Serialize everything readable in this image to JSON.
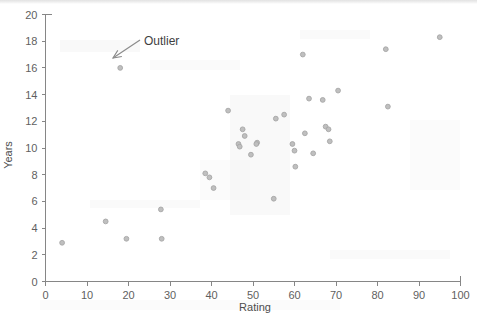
{
  "chart_data": {
    "type": "scatter",
    "title": "",
    "xlabel": "Rating",
    "ylabel": "Years",
    "xlim": [
      0,
      100
    ],
    "ylim": [
      0,
      20
    ],
    "xticks": [
      0,
      10,
      20,
      30,
      40,
      50,
      60,
      70,
      80,
      90,
      100
    ],
    "yticks": [
      0,
      2,
      4,
      6,
      8,
      10,
      12,
      14,
      16,
      18,
      20
    ],
    "xtick_labels": [
      "0",
      "10",
      "20",
      "30",
      "40",
      "50",
      "60",
      "70",
      "80",
      "90",
      "100"
    ],
    "ytick_labels": [
      "0",
      "2",
      "4",
      "6",
      "8",
      "10",
      "12",
      "14",
      "16",
      "18",
      "20"
    ],
    "grid": false,
    "legend": false,
    "marker_color": "#bfbfbf",
    "marker_edge_color": "#a6a6a6",
    "points": [
      {
        "x": 4,
        "y": 2.9
      },
      {
        "x": 14.5,
        "y": 4.5
      },
      {
        "x": 18,
        "y": 16.0
      },
      {
        "x": 19.5,
        "y": 3.2
      },
      {
        "x": 27.8,
        "y": 5.4
      },
      {
        "x": 28,
        "y": 3.2
      },
      {
        "x": 38.5,
        "y": 8.1
      },
      {
        "x": 39.5,
        "y": 7.8
      },
      {
        "x": 40.5,
        "y": 7.0
      },
      {
        "x": 44,
        "y": 12.8
      },
      {
        "x": 47.5,
        "y": 11.4
      },
      {
        "x": 48,
        "y": 10.9
      },
      {
        "x": 46.5,
        "y": 10.3
      },
      {
        "x": 46.8,
        "y": 10.1
      },
      {
        "x": 49.5,
        "y": 9.5
      },
      {
        "x": 51,
        "y": 10.4
      },
      {
        "x": 50.8,
        "y": 10.3
      },
      {
        "x": 55,
        "y": 6.2
      },
      {
        "x": 55.5,
        "y": 12.2
      },
      {
        "x": 57.5,
        "y": 12.5
      },
      {
        "x": 59.5,
        "y": 10.3
      },
      {
        "x": 60,
        "y": 9.8
      },
      {
        "x": 60.2,
        "y": 8.6
      },
      {
        "x": 62,
        "y": 17.0
      },
      {
        "x": 62.5,
        "y": 11.1
      },
      {
        "x": 63.5,
        "y": 13.7
      },
      {
        "x": 64.5,
        "y": 9.6
      },
      {
        "x": 66.8,
        "y": 13.6
      },
      {
        "x": 67.5,
        "y": 11.6
      },
      {
        "x": 68.2,
        "y": 11.4
      },
      {
        "x": 68.5,
        "y": 10.5
      },
      {
        "x": 70.5,
        "y": 14.3
      },
      {
        "x": 82,
        "y": 17.4
      },
      {
        "x": 82.5,
        "y": 13.1
      },
      {
        "x": 95,
        "y": 18.3
      }
    ],
    "annotations": [
      {
        "text": "Outlier",
        "label_x": 144,
        "label_y": 45,
        "arrow_from_x": 140,
        "arrow_from_y": 40,
        "arrow_to_x": 113,
        "arrow_to_y": 58,
        "points_to": {
          "x": 18,
          "y": 16.0
        }
      }
    ]
  },
  "axes": {
    "x_axis_name": "Rating",
    "y_axis_name": "Years"
  }
}
